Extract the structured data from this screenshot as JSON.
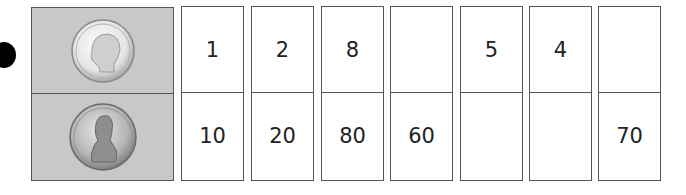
{
  "coins": {
    "top": {
      "name": "dime",
      "label": "LIBERTY",
      "year": "2003"
    },
    "bottom": {
      "name": "penny",
      "label": "LIBERTY",
      "year": "2001"
    }
  },
  "table": {
    "columns": [
      {
        "dimes": "1",
        "pennies": "10"
      },
      {
        "dimes": "2",
        "pennies": "20"
      },
      {
        "dimes": "8",
        "pennies": "80"
      },
      {
        "dimes": "",
        "pennies": "60"
      },
      {
        "dimes": "5",
        "pennies": ""
      },
      {
        "dimes": "4",
        "pennies": ""
      },
      {
        "dimes": "",
        "pennies": "70"
      }
    ]
  }
}
